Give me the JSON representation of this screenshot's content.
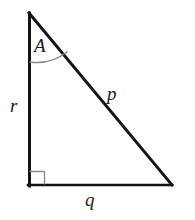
{
  "figure": {
    "kind": "right-triangle-diagram",
    "background_color": "#ffffff",
    "stroke_color": "#141414",
    "arc_color": "#8a8a8a",
    "right_angle_marker_color": "#8c8c8c",
    "vertices": {
      "apex": {
        "x": 29,
        "y": 13
      },
      "bottom_left": {
        "x": 29,
        "y": 186
      },
      "bottom_right": {
        "x": 172,
        "y": 185
      }
    },
    "sides": [
      {
        "name": "hypotenuse",
        "label": "p",
        "from": "apex",
        "to": "bottom_right"
      },
      {
        "name": "base",
        "label": "q",
        "from": "bottom_left",
        "to": "bottom_right"
      },
      {
        "name": "vertical-leg",
        "label": "r",
        "from": "apex",
        "to": "bottom_left"
      }
    ],
    "angles": [
      {
        "name": "apex-angle",
        "label": "A",
        "vertex": "apex",
        "marker": "arc"
      },
      {
        "name": "right-angle",
        "label": "",
        "vertex": "bottom_left",
        "marker": "square",
        "degrees": 90
      }
    ]
  },
  "labels": {
    "angle_A": "A",
    "side_p": "p",
    "side_q": "q",
    "side_r": "r"
  }
}
